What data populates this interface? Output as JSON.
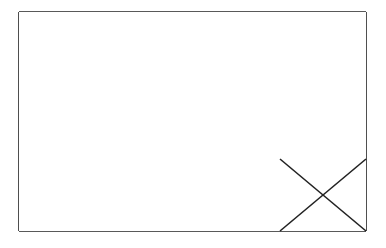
{
  "diagram": {
    "type": "grid",
    "rows": 3,
    "columns": 4,
    "line_color": "#222222",
    "background": "#ffffff",
    "bounds": {
      "left": 19,
      "top": 12,
      "right": 366,
      "bottom": 231
    },
    "column_edges": [
      19,
      106,
      193,
      280,
      366
    ],
    "row_edges": [
      12,
      86,
      159,
      231
    ],
    "marked_cells": [
      {
        "row": 2,
        "column": 3,
        "mark": "x-cross"
      }
    ]
  }
}
